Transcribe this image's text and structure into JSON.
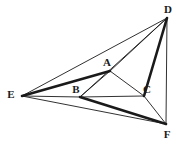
{
  "figure": {
    "background_color": "#ffffff",
    "line_color": "#1a1a1a",
    "thin_stroke_width": 0.9,
    "thick_stroke_width": 2.6,
    "canvas": {
      "width": 183,
      "height": 145
    },
    "vertices": [
      {
        "id": "A",
        "label": "A",
        "x": 110,
        "y": 71,
        "label_x": 107,
        "label_y": 63
      },
      {
        "id": "B",
        "label": "B",
        "x": 80,
        "y": 97,
        "label_x": 76,
        "label_y": 90
      },
      {
        "id": "C",
        "label": "C",
        "x": 144,
        "y": 96,
        "label_x": 147,
        "label_y": 90
      },
      {
        "id": "D",
        "label": "D",
        "x": 167,
        "y": 18,
        "label_x": 168,
        "label_y": 10
      },
      {
        "id": "E",
        "label": "E",
        "x": 22,
        "y": 96,
        "label_x": 11,
        "label_y": 95
      },
      {
        "id": "F",
        "label": "F",
        "x": 166,
        "y": 124,
        "label_x": 167,
        "label_y": 135
      }
    ],
    "segments": [
      {
        "id": "EA",
        "from": "E",
        "to": "A",
        "weight": "thick"
      },
      {
        "id": "BF",
        "from": "B",
        "to": "F",
        "weight": "thick"
      },
      {
        "id": "CD",
        "from": "C",
        "to": "D",
        "weight": "thick"
      },
      {
        "id": "ED",
        "from": "E",
        "to": "D",
        "weight": "thin"
      },
      {
        "id": "EB",
        "from": "E",
        "to": "B",
        "weight": "thin"
      },
      {
        "id": "EF",
        "from": "E",
        "to": "F",
        "weight": "thin"
      },
      {
        "id": "DF",
        "from": "D",
        "to": "F",
        "weight": "thin"
      },
      {
        "id": "AD",
        "from": "A",
        "to": "D",
        "weight": "thin"
      },
      {
        "id": "BD",
        "from": "B",
        "to": "D",
        "weight": "thin"
      },
      {
        "id": "AB",
        "from": "A",
        "to": "B",
        "weight": "thin"
      },
      {
        "id": "AC",
        "from": "A",
        "to": "C",
        "weight": "thin"
      },
      {
        "id": "BC",
        "from": "B",
        "to": "C",
        "weight": "thin"
      },
      {
        "id": "CF",
        "from": "C",
        "to": "F",
        "weight": "thin"
      }
    ]
  }
}
